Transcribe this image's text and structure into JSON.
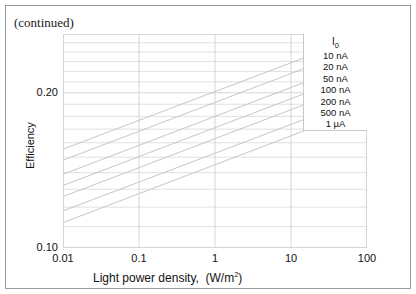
{
  "figure": {
    "note": "(continued)",
    "frame_color": "#9b9b9b"
  },
  "chart_data": {
    "type": "line",
    "title": "",
    "xlabel": "Light power density,  (W/m2)",
    "xlabel_main": "Light power density,",
    "xlabel_units_pre": "(W/m",
    "xlabel_units_sup": "2",
    "xlabel_units_post": ")",
    "ylabel": "Efficiency",
    "xscale": "log",
    "yscale": "log",
    "xlim": [
      0.01,
      100
    ],
    "ylim": [
      0.1,
      0.26
    ],
    "xticks": [
      0.01,
      0.1,
      1,
      10,
      100
    ],
    "xticklabels": [
      "0.01",
      "0.1",
      "1",
      "10",
      "100"
    ],
    "yticks": [
      0.1,
      0.2
    ],
    "yticklabels": [
      "0.10",
      "0.20"
    ],
    "yminor": [
      0.11,
      0.12,
      0.13,
      0.14,
      0.15,
      0.16,
      0.17,
      0.18,
      0.19,
      0.21,
      0.22,
      0.23,
      0.24,
      0.25
    ],
    "grid": true,
    "grid_color": "#cccccc",
    "line_color": "#bfbfbf",
    "legend": {
      "position": "top-right",
      "title": "I0",
      "title_base": "I",
      "title_sub": "0",
      "entries": [
        "10 nA",
        "20 nA",
        "50 nA",
        "100 nA",
        "200 nA",
        "500 nA",
        "1 µA"
      ]
    },
    "series": [
      {
        "name": "10 nA",
        "x": [
          0.01,
          100
        ],
        "y": [
          0.1555,
          0.26
        ]
      },
      {
        "name": "20 nA",
        "x": [
          0.01,
          100
        ],
        "y": [
          0.148,
          0.248
        ]
      },
      {
        "name": "50 nA",
        "x": [
          0.01,
          100
        ],
        "y": [
          0.139,
          0.233
        ]
      },
      {
        "name": "100 nA",
        "x": [
          0.01,
          100
        ],
        "y": [
          0.1322,
          0.2215
        ]
      },
      {
        "name": "200 nA",
        "x": [
          0.01,
          100
        ],
        "y": [
          0.1258,
          0.211
        ]
      },
      {
        "name": "500 nA",
        "x": [
          0.01,
          100
        ],
        "y": [
          0.118,
          0.1975
        ]
      },
      {
        "name": "1 µA",
        "x": [
          0.01,
          100
        ],
        "y": [
          0.112,
          0.1878
        ]
      }
    ]
  }
}
